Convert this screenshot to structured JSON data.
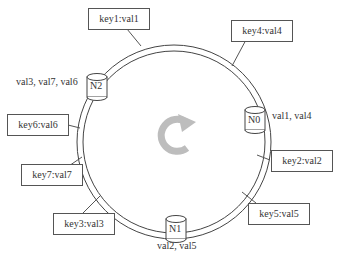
{
  "diagram": {
    "type": "consistent-hash-ring",
    "center_icon": "rotate-clockwise-icon",
    "nodes": [
      {
        "id": "N0",
        "label": "N0",
        "values": "val1, val4"
      },
      {
        "id": "N1",
        "label": "N1",
        "values": "val2, val5"
      },
      {
        "id": "N2",
        "label": "N2",
        "values": "val3, val7, val6"
      }
    ],
    "keys": [
      {
        "label": "key1:val1"
      },
      {
        "label": "key4:val4"
      },
      {
        "label": "key6:val6"
      },
      {
        "label": "key2:val2"
      },
      {
        "label": "key7:val7"
      },
      {
        "label": "key5:val5"
      },
      {
        "label": "key3:val3"
      }
    ]
  }
}
